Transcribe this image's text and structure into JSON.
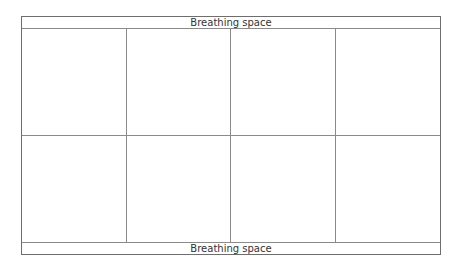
{
  "diagram": {
    "header_label": "Breathing space",
    "footer_label": "Breathing space",
    "grid": {
      "rows": 2,
      "columns": 4,
      "cells": [
        {
          "row": 1,
          "col": 1,
          "label": ""
        },
        {
          "row": 1,
          "col": 2,
          "label": ""
        },
        {
          "row": 1,
          "col": 3,
          "label": ""
        },
        {
          "row": 1,
          "col": 4,
          "label": ""
        },
        {
          "row": 2,
          "col": 1,
          "label": ""
        },
        {
          "row": 2,
          "col": 2,
          "label": ""
        },
        {
          "row": 2,
          "col": 3,
          "label": ""
        },
        {
          "row": 2,
          "col": 4,
          "label": ""
        }
      ]
    },
    "colors": {
      "line": "#8a8a8a",
      "border": "#6e6e6e",
      "text": "#333333",
      "background": "#ffffff"
    }
  }
}
